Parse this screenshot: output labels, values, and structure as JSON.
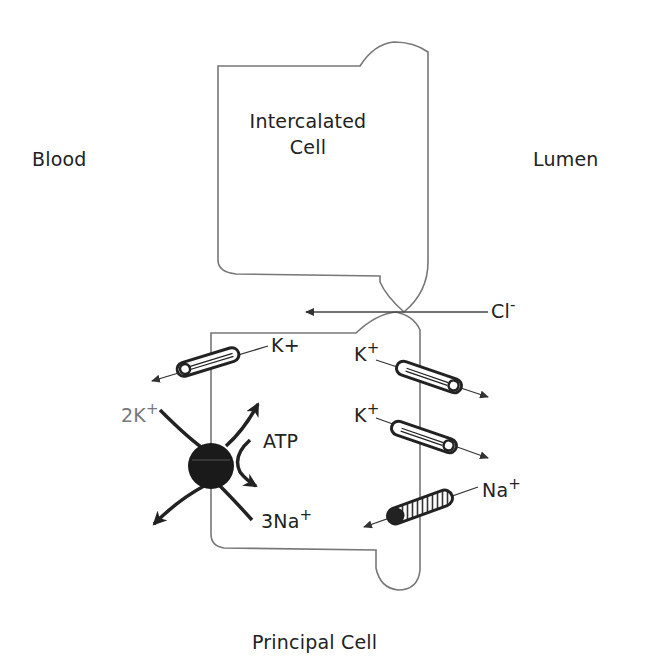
{
  "diagram": {
    "regions": {
      "blood": "Blood",
      "lumen": "Lumen"
    },
    "cells": {
      "intercalated_line1": "Intercalated",
      "intercalated_line2": "Cell",
      "principal": "Principal Cell"
    },
    "ions": {
      "cl": {
        "base": "Cl",
        "sup": "-"
      },
      "k_basolateral": {
        "base": "K+",
        "sup": ""
      },
      "k_apical_1": {
        "base": "K",
        "sup": "+"
      },
      "k_apical_2": {
        "base": "K",
        "sup": "+"
      },
      "na_apical": {
        "base": "Na",
        "sup": "+"
      },
      "pump_k": {
        "base": "2K",
        "sup": "+"
      },
      "pump_na": {
        "base": "3Na",
        "sup": "+"
      },
      "atp": "ATP"
    },
    "colors": {
      "outline": "#777777",
      "ink": "#222222",
      "pump": "#1a1a1a"
    }
  }
}
